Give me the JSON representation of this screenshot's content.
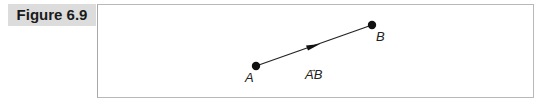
{
  "figure": {
    "label": "Figure 6.9",
    "points": [
      {
        "name": "A",
        "x": 256,
        "y": 66
      },
      {
        "name": "B",
        "x": 372,
        "y": 25
      }
    ],
    "vector_label": "AB",
    "vector_arrow": "→"
  }
}
